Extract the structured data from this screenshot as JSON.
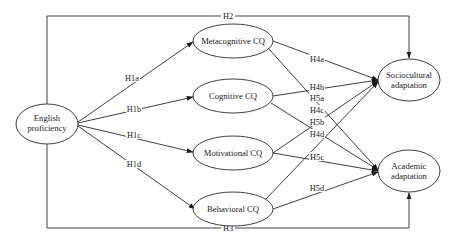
{
  "diagram": {
    "type": "path-model",
    "nodes": {
      "english": {
        "line1": "English",
        "line2": "proficiency"
      },
      "meta": {
        "label": "Metacognitive CQ"
      },
      "cog": {
        "label": "Cognitive CQ"
      },
      "mot": {
        "label": "Motivational CQ"
      },
      "beh": {
        "label": "Behavioral CQ"
      },
      "socio": {
        "line1": "Sociocultural",
        "line2": "adaptation"
      },
      "acad": {
        "line1": "Academic",
        "line2": "adaptation"
      }
    },
    "edges": {
      "H1a": "H1a",
      "H1b": "H1b",
      "H1c": "H1c",
      "H1d": "H1d",
      "H2": "H2",
      "H3": "H3",
      "H4a": "H4a",
      "H4b": "H4b",
      "H4c": "H4c",
      "H4d": "H4d",
      "H5a": "H5a",
      "H5b": "H5b",
      "H5c": "H5c",
      "H5d": "H5d"
    },
    "relations": [
      {
        "id": "H1a",
        "from": "English proficiency",
        "to": "Metacognitive CQ"
      },
      {
        "id": "H1b",
        "from": "English proficiency",
        "to": "Cognitive CQ"
      },
      {
        "id": "H1c",
        "from": "English proficiency",
        "to": "Motivational CQ"
      },
      {
        "id": "H1d",
        "from": "English proficiency",
        "to": "Behavioral CQ"
      },
      {
        "id": "H2",
        "from": "English proficiency",
        "to": "Sociocultural adaptation"
      },
      {
        "id": "H3",
        "from": "English proficiency",
        "to": "Academic adaptation"
      },
      {
        "id": "H4a",
        "from": "Metacognitive CQ",
        "to": "Sociocultural adaptation"
      },
      {
        "id": "H4b",
        "from": "Cognitive CQ",
        "to": "Sociocultural adaptation"
      },
      {
        "id": "H4c",
        "from": "Motivational CQ",
        "to": "Sociocultural adaptation"
      },
      {
        "id": "H4d",
        "from": "Behavioral CQ",
        "to": "Sociocultural adaptation"
      },
      {
        "id": "H5a",
        "from": "Metacognitive CQ",
        "to": "Academic adaptation"
      },
      {
        "id": "H5b",
        "from": "Cognitive CQ",
        "to": "Academic adaptation"
      },
      {
        "id": "H5c",
        "from": "Motivational CQ",
        "to": "Academic adaptation"
      },
      {
        "id": "H5d",
        "from": "Behavioral CQ",
        "to": "Academic adaptation"
      }
    ]
  }
}
